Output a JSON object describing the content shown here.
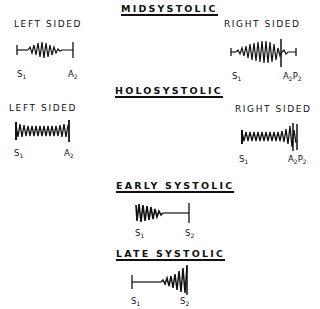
{
  "sections": {
    "midsystolic": {
      "title": "MIDSYSTOLIC",
      "left": {
        "label": "LEFT SIDED",
        "markers": [
          {
            "base": "S",
            "sub": "1"
          },
          {
            "base": "A",
            "sub": "2"
          }
        ]
      },
      "right": {
        "label": "RIGHT SIDED",
        "markers": [
          {
            "base": "S",
            "sub": "1"
          },
          {
            "base": "A",
            "sub": "2",
            "base2": "P",
            "sub2": "2"
          }
        ]
      }
    },
    "holosystolic": {
      "title": "HOLOSYSTOLIC",
      "left": {
        "label": "LEFT SIDED",
        "markers": [
          {
            "base": "S",
            "sub": "1"
          },
          {
            "base": "A",
            "sub": "2"
          }
        ]
      },
      "right": {
        "label": "RIGHT SIDED",
        "markers": [
          {
            "base": "S",
            "sub": "1"
          },
          {
            "base": "A",
            "sub": "2",
            "base2": "P",
            "sub2": "2"
          }
        ]
      }
    },
    "early_systolic": {
      "title": "EARLY SYSTOLIC",
      "markers": [
        {
          "base": "S",
          "sub": "1"
        },
        {
          "base": "S",
          "sub": "2"
        }
      ]
    },
    "late_systolic": {
      "title": "LATE SYSTOLIC",
      "markers": [
        {
          "base": "S",
          "sub": "1"
        },
        {
          "base": "S",
          "sub": "2"
        }
      ]
    }
  }
}
